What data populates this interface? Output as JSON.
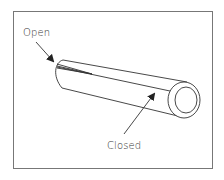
{
  "diagram": {
    "labels": {
      "open": "Open",
      "closed": "Closed"
    },
    "colors": {
      "line": "#333333",
      "border": "#777777",
      "background": "#ffffff"
    }
  }
}
